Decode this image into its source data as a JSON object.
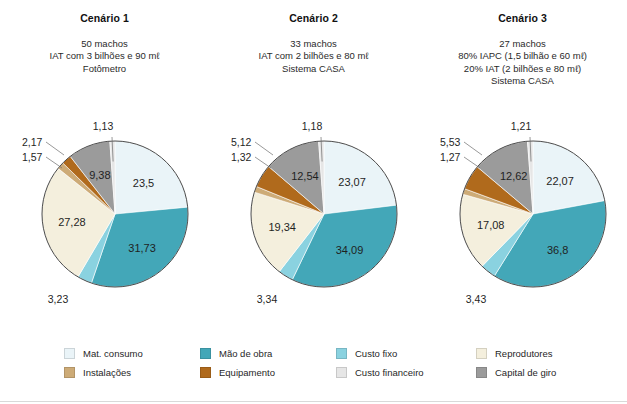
{
  "scenarios": [
    {
      "title": "Cenário 1",
      "lines": [
        "50 machos",
        "IAT com 3 bilhões e 90 mℓ",
        "Fotômetro"
      ]
    },
    {
      "title": "Cenário 2",
      "lines": [
        "33 machos",
        "IAT com 2 bilhões e 80 mℓ",
        "Sistema CASA"
      ]
    },
    {
      "title": "Cenário 3",
      "lines": [
        "27 machos",
        "80% IAPC (1,5 bilhão e 60 mℓ)",
        "20% IAT (2 bilhões e 80 mℓ)",
        "Sistema CASA"
      ]
    }
  ],
  "legend": {
    "items": [
      {
        "label": "Mat. consumo",
        "color": "#eaf4f8"
      },
      {
        "label": "Instalações",
        "color": "#cdab77"
      },
      {
        "label": "Mão de obra",
        "color": "#43a7b8"
      },
      {
        "label": "Equipamento",
        "color": "#b06a1c"
      },
      {
        "label": "Custo fixo",
        "color": "#8ad2e0"
      },
      {
        "label": "Custo financeiro",
        "color": "#e6e6e6"
      },
      {
        "label": "Reprodutores",
        "color": "#f4efdd"
      },
      {
        "label": "Capital de giro",
        "color": "#9b9b9b"
      }
    ]
  },
  "chart_data": [
    {
      "type": "pie",
      "title": "Cenário 1",
      "categories": [
        "Mat. consumo",
        "Mão de obra",
        "Custo fixo",
        "Reprodutores",
        "Instalações",
        "Equipamento",
        "Capital de giro",
        "Custo financeiro"
      ],
      "values": [
        23.5,
        31.73,
        3.23,
        27.28,
        1.57,
        2.17,
        9.38,
        1.13
      ],
      "labels": [
        "23,5",
        "31,73",
        "3,23",
        "27,28",
        "1,57",
        "2,17",
        "9,38",
        "1,13"
      ],
      "colors": [
        "#eaf4f8",
        "#43a7b8",
        "#8ad2e0",
        "#f4efdd",
        "#cdab77",
        "#b06a1c",
        "#9b9b9b",
        "#e6e6e6"
      ],
      "legend_position": "bottom"
    },
    {
      "type": "pie",
      "title": "Cenário 2",
      "categories": [
        "Mat. consumo",
        "Mão de obra",
        "Custo fixo",
        "Reprodutores",
        "Instalações",
        "Equipamento",
        "Capital de giro",
        "Custo financeiro"
      ],
      "values": [
        23.07,
        34.09,
        3.34,
        19.34,
        1.32,
        5.12,
        12.54,
        1.18
      ],
      "labels": [
        "23,07",
        "34,09",
        "3,34",
        "19,34",
        "1,32",
        "5,12",
        "12,54",
        "1,18"
      ],
      "colors": [
        "#eaf4f8",
        "#43a7b8",
        "#8ad2e0",
        "#f4efdd",
        "#cdab77",
        "#b06a1c",
        "#9b9b9b",
        "#e6e6e6"
      ],
      "legend_position": "bottom"
    },
    {
      "type": "pie",
      "title": "Cenário 3",
      "categories": [
        "Mat. consumo",
        "Mão de obra",
        "Custo fixo",
        "Reprodutores",
        "Instalações",
        "Equipamento",
        "Capital de giro",
        "Custo financeiro"
      ],
      "values": [
        22.07,
        36.8,
        3.43,
        17.08,
        1.27,
        5.53,
        12.62,
        1.21
      ],
      "labels": [
        "22,07",
        "36,8",
        "3,43",
        "17,08",
        "1,27",
        "5,53",
        "12,62",
        "1,21"
      ],
      "colors": [
        "#eaf4f8",
        "#43a7b8",
        "#8ad2e0",
        "#f4efdd",
        "#cdab77",
        "#b06a1c",
        "#9b9b9b",
        "#e6e6e6"
      ],
      "legend_position": "bottom"
    }
  ]
}
